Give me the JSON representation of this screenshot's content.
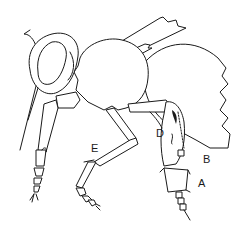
{
  "figure": {
    "line_color": "#1a1a1a",
    "background": "#ffffff",
    "labels": [
      {
        "id": "A",
        "text": "A",
        "x": 198,
        "y": 178
      },
      {
        "id": "B",
        "text": "B",
        "x": 203,
        "y": 154
      },
      {
        "id": "D",
        "text": "D",
        "x": 159,
        "y": 129
      },
      {
        "id": "E",
        "text": "E",
        "x": 92,
        "y": 144
      }
    ]
  }
}
